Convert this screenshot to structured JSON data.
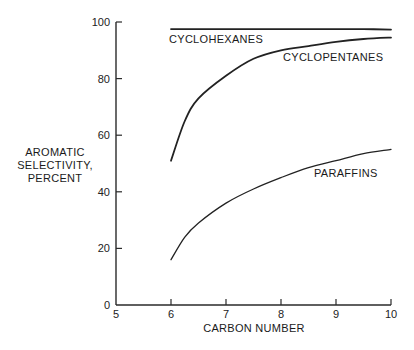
{
  "chart_data": {
    "type": "line",
    "title": "",
    "xlabel": "CARBON NUMBER",
    "ylabel": "AROMATIC SELECTIVITY, PERCENT",
    "ylabel_lines": [
      "AROMATIC",
      "SELECTIVITY,",
      "PERCENT"
    ],
    "xlim": [
      5,
      10
    ],
    "ylim": [
      0,
      100
    ],
    "xticks": [
      5,
      6,
      7,
      8,
      9,
      10
    ],
    "yticks": [
      0,
      20,
      40,
      60,
      80,
      100
    ],
    "grid": false,
    "legend": "inline labels",
    "x": [
      6,
      6.25,
      6.5,
      7,
      7.5,
      8,
      8.5,
      9,
      9.5,
      10
    ],
    "series": [
      {
        "name": "CYCLOHEXANES",
        "values": [
          97.5,
          97.5,
          97.5,
          97.5,
          97.5,
          97.5,
          97.5,
          97.5,
          97.5,
          97.3
        ]
      },
      {
        "name": "CYCLOPENTANES",
        "values": [
          51,
          65,
          73,
          81,
          87,
          90,
          91.5,
          93,
          94,
          94.5
        ]
      },
      {
        "name": "PARAFFINS",
        "values": [
          16,
          24,
          29,
          36,
          41,
          45,
          48.5,
          51,
          53.5,
          55
        ]
      }
    ]
  }
}
